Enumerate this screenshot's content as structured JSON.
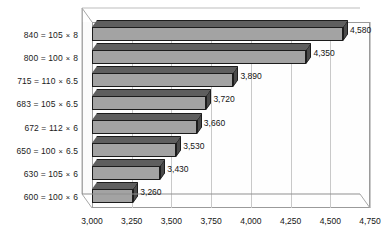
{
  "chart_data": {
    "type": "bar",
    "orientation": "horizontal",
    "style": "3d",
    "title": "",
    "xlabel": "",
    "ylabel": "",
    "xlim": [
      3000,
      4750
    ],
    "xticks": [
      "3,000",
      "3,250",
      "3,500",
      "3,750",
      "4,000",
      "4,250",
      "4,500",
      "4,750"
    ],
    "xtick_values": [
      3000,
      3250,
      3500,
      3750,
      4000,
      4250,
      4500,
      4750
    ],
    "grid": true,
    "legend": false,
    "categories": [
      "840 = 105 × 8",
      "800 = 100 × 8",
      "715 = 110 × 6.5",
      "683 = 105 × 6.5",
      "672 = 112 × 6",
      "650 = 100 × 6.5",
      "630 = 105 × 6",
      "600 = 100 × 6"
    ],
    "values": [
      4580,
      4350,
      3890,
      3720,
      3660,
      3530,
      3430,
      3260
    ],
    "data_labels": [
      "4,580",
      "4,350",
      "3,890",
      "3,720",
      "3,660",
      "3,530",
      "3,430",
      "3,260"
    ],
    "colors": {
      "bar_front": "#a3a3a3",
      "bar_top": "#5e5e5e",
      "bar_side": "#4a4a4a",
      "bar_outline": "#1c1c1c",
      "gridline": "#c9c9c9",
      "axis": "#9a9a9a",
      "plot_background": "#fefefe",
      "text": "#141414"
    }
  }
}
